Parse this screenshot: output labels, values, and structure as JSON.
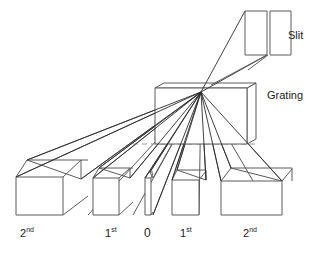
{
  "figure": {
    "type": "optics-ray-diagram",
    "background_color": "#ffffff",
    "line_color": "#5a5a5a",
    "ray_color": "#2b2b2b",
    "dash_color": "#9a9a9a"
  },
  "components": {
    "slit": {
      "label": "Slit",
      "label_x": 288,
      "label_y": 30
    },
    "grating": {
      "label": "Grating",
      "label_x": 267,
      "label_y": 90
    }
  },
  "orders": [
    {
      "id": "left-2nd",
      "label": "2",
      "suffix": "nd",
      "x": 20,
      "y": 228
    },
    {
      "id": "left-1st",
      "label": "1",
      "suffix": "st",
      "x": 105,
      "y": 228
    },
    {
      "id": "zero",
      "label": "0",
      "suffix": "",
      "x": 144,
      "y": 227
    },
    {
      "id": "right-1st",
      "label": "1",
      "suffix": "st",
      "x": 180,
      "y": 228
    },
    {
      "id": "right-2nd",
      "label": "2",
      "suffix": "nd",
      "x": 243,
      "y": 228
    }
  ],
  "geometry": {
    "convergence_point_x": 201,
    "convergence_point_y": 92,
    "optical_axis_y": 144,
    "optical_axis_x_start": 133,
    "optical_axis_x_end": 256
  }
}
